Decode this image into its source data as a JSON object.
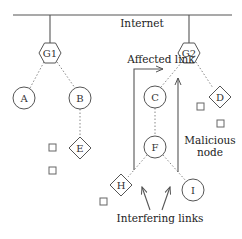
{
  "diagram": {
    "internet_label": "Internet",
    "gateways": [
      {
        "id": "G1",
        "label": "G1",
        "x": 50,
        "y": 53
      },
      {
        "id": "G2",
        "label": "G2",
        "x": 189,
        "y": 53
      }
    ],
    "circle_nodes": [
      {
        "id": "A",
        "label": "A",
        "x": 24,
        "y": 98
      },
      {
        "id": "B",
        "label": "B",
        "x": 80,
        "y": 98
      },
      {
        "id": "C",
        "label": "C",
        "x": 155,
        "y": 97
      },
      {
        "id": "F",
        "label": "F",
        "x": 155,
        "y": 147
      },
      {
        "id": "I",
        "label": "I",
        "x": 193,
        "y": 190
      }
    ],
    "diamond_nodes": [
      {
        "id": "E",
        "label": "E",
        "x": 80,
        "y": 148
      },
      {
        "id": "D",
        "label": "D",
        "x": 220,
        "y": 97
      },
      {
        "id": "H",
        "label": "H",
        "x": 121,
        "y": 185
      }
    ],
    "annotations": {
      "affected_link": "Affected link",
      "malicious_line1": "Malicious",
      "malicious_line2": "node",
      "interfering_links": "Interfering links"
    },
    "colors": {
      "stroke": "#555555",
      "dotted": "#888888",
      "background": "#ffffff"
    }
  }
}
